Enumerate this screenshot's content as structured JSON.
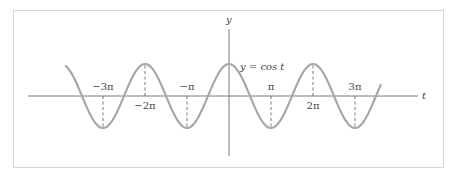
{
  "chart_data": {
    "type": "line",
    "title": "",
    "function_label": "y = cos t",
    "xlabel": "t",
    "ylabel": "y",
    "xlim_pi": [
      -3.9,
      3.62
    ],
    "ylim": [
      -1,
      1
    ],
    "grid": false,
    "series": [
      {
        "name": "y = cos t",
        "expression": "cos(t)",
        "t_range_pi": [
          -3.9,
          3.62
        ]
      }
    ],
    "ticks": [
      {
        "value_pi": -3,
        "label": "−3π",
        "position": "above"
      },
      {
        "value_pi": -2,
        "label": "−2π",
        "position": "below"
      },
      {
        "value_pi": -1,
        "label": "−π",
        "position": "above"
      },
      {
        "value_pi": 1,
        "label": "π",
        "position": "above"
      },
      {
        "value_pi": 2,
        "label": "2π",
        "position": "below"
      },
      {
        "value_pi": 3,
        "label": "3π",
        "position": "above"
      }
    ],
    "colors": {
      "curve": "#a8a8a8",
      "axis": "#7a7a7a",
      "frame": "#d6d6d6"
    }
  }
}
